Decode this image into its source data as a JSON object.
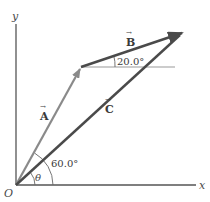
{
  "diagram": {
    "type": "vector-addition",
    "axes": {
      "x_label": "x",
      "y_label": "y",
      "origin_label": "O"
    },
    "vectors": [
      {
        "id": "A",
        "label": "A",
        "from": "O",
        "to": "tip_A",
        "color": "#8a8a8a"
      },
      {
        "id": "B",
        "label": "B",
        "from": "tip_A",
        "to": "tip_B",
        "color": "#4a4a4a"
      },
      {
        "id": "C",
        "label": "C",
        "from": "O",
        "to": "tip_B",
        "color": "#4a4a4a"
      }
    ],
    "angles": {
      "b_angle": "20.0°",
      "a_angle": "60.0°",
      "theta": "θ"
    },
    "arrow_glyph": "→",
    "colors": {
      "axis": "#555555",
      "vector_a": "#8a8a8a",
      "vector_bc": "#4a4a4a",
      "reference_line": "#9a9a9a",
      "arc": "#666666"
    }
  }
}
